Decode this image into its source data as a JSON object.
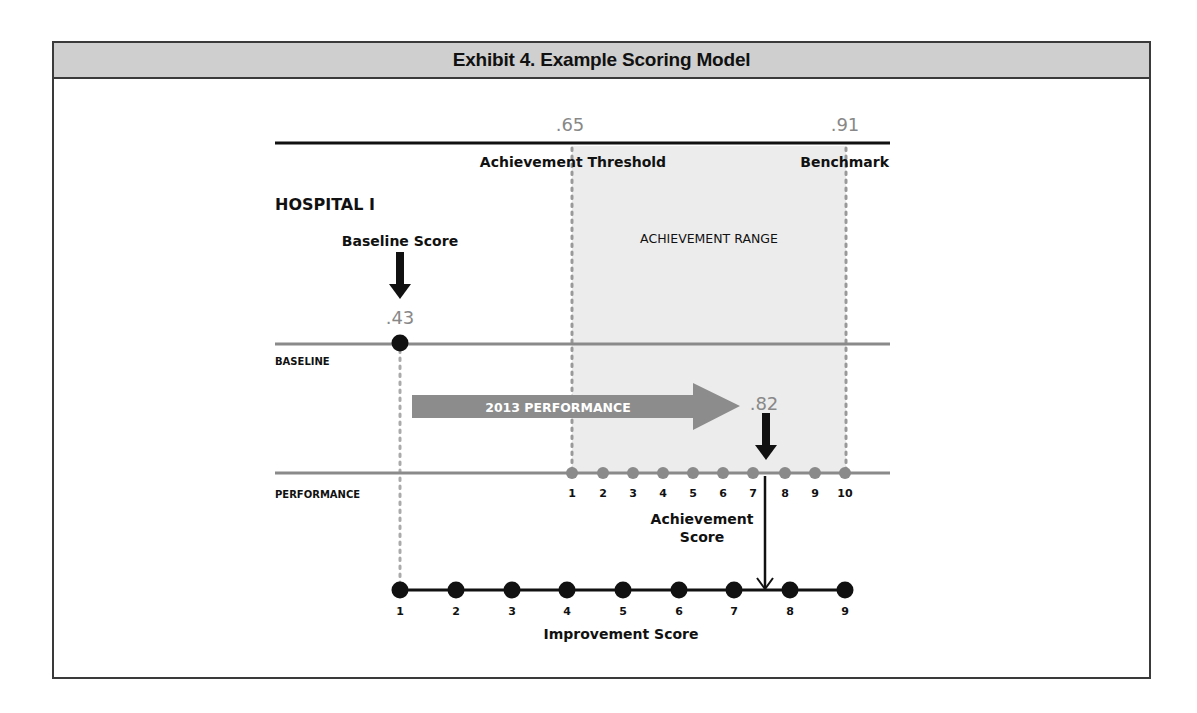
{
  "header": {
    "title": "Exhibit 4. Example Scoring Model"
  },
  "diagram": {
    "hospital_label": "HOSPITAL I",
    "threshold": {
      "value": ".65",
      "label": "Achievement Threshold"
    },
    "benchmark": {
      "value": ".91",
      "label": "Benchmark"
    },
    "achievement_range_label": "ACHIEVEMENT RANGE",
    "baseline": {
      "row_label": "BASELINE",
      "score_label": "Baseline Score",
      "value": ".43"
    },
    "performance": {
      "row_label": "PERFORMANCE",
      "arrow_label": "2013 PERFORMANCE",
      "value": ".82"
    },
    "achievement_score_label_1": "Achievement",
    "achievement_score_label_2": "Score",
    "improvement_score_label": "Improvement Score",
    "achievement_ticks": [
      "1",
      "2",
      "3",
      "4",
      "5",
      "6",
      "7",
      "8",
      "9",
      "10"
    ],
    "improvement_ticks": [
      "1",
      "2",
      "3",
      "4",
      "5",
      "6",
      "7",
      "8",
      "9"
    ]
  },
  "colors": {
    "frame": "#3a3a3a",
    "header_bg": "#cfcfcf",
    "range_bg": "#ececec",
    "gray_line": "#8a8a8a",
    "arrow_gray": "#8c8c8c",
    "number_gray": "#888888"
  }
}
